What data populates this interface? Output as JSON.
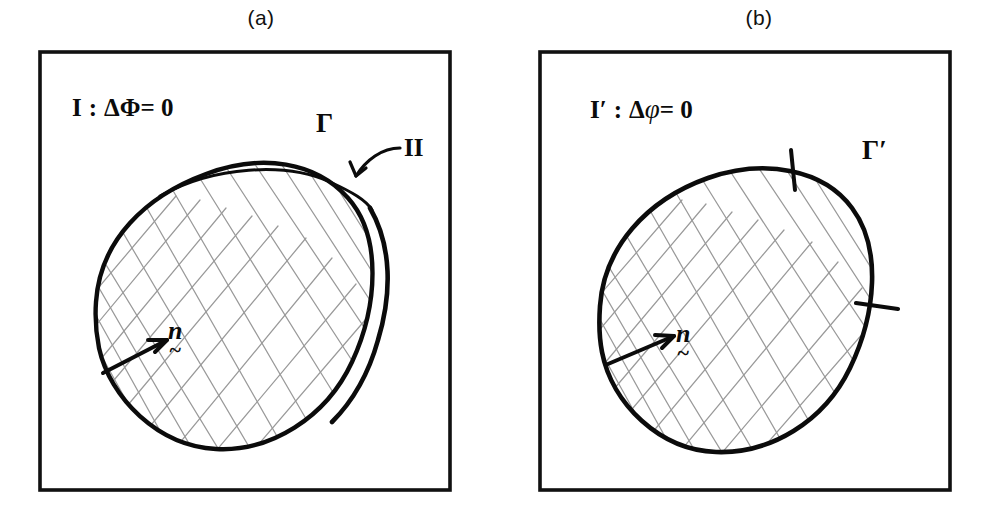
{
  "figure": {
    "type": "hand-drawn-diagram",
    "background_color": "#ffffff",
    "ink_color": "#0b0b0b",
    "hatch_color": "#8d8d8d",
    "panel_count": 2
  },
  "panels": [
    {
      "id": "a",
      "caption": "(a)",
      "region_label": "I",
      "region_prime": "",
      "equation_delta": "Δ",
      "equation_potential": "Φ",
      "equation_rhs": "= 0",
      "equation_separator": ":",
      "boundary_label": "Γ",
      "secondary_region_label": "II",
      "normal_symbol": "n",
      "normal_underaccent": "~",
      "has_outer_sliver": true,
      "tick_count": 0,
      "frame": {
        "x": 40,
        "y": 52,
        "width": 410,
        "height": 438
      }
    },
    {
      "id": "b",
      "caption": "(b)",
      "region_label": "I",
      "region_prime": "′",
      "equation_delta": "Δ",
      "equation_potential": "φ",
      "equation_rhs": "= 0",
      "equation_separator": ":",
      "boundary_label": "Γ′",
      "secondary_region_label": "",
      "normal_symbol": "n",
      "normal_underaccent": "~",
      "has_outer_sliver": false,
      "tick_count": 2,
      "frame": {
        "x": 46,
        "y": 52,
        "width": 410,
        "height": 438
      }
    }
  ]
}
